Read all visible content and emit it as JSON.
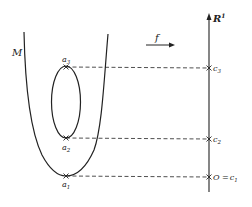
{
  "diagram": {
    "manifold_label": "M",
    "map_label": "f",
    "axis_label": "R",
    "axis_superscript": "1",
    "critical_points": [
      {
        "name": "a",
        "sub": "3",
        "value_name": "c",
        "value_sub": "3",
        "value_prefix": ""
      },
      {
        "name": "a",
        "sub": "2",
        "value_name": "c",
        "value_sub": "2",
        "value_prefix": ""
      },
      {
        "name": "a",
        "sub": "1",
        "value_name": "c",
        "value_sub": "1",
        "value_prefix": "O ="
      }
    ],
    "colors": {
      "stroke": "#222222",
      "background": "#ffffff"
    }
  }
}
